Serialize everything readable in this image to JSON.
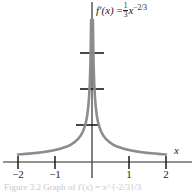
{
  "figure": {
    "function_label": {
      "fname": "f",
      "prime": "′",
      "arg": "(x)",
      "equals": "=",
      "frac_num": "1",
      "frac_den": "3",
      "base": "x",
      "exponent": "−2/3",
      "plain": "f'(x) = (1/3)x^(-2/3)"
    },
    "axis_label_x": "x",
    "caption": "Figure 3.2  Graph of f'(x) = x^{-2/3}/3",
    "colors": {
      "curve": "#8c8c8c",
      "axis": "#6e6e6e",
      "tick": "#1a1a1a",
      "text": "#1a1a1a",
      "background": "#ffffff"
    }
  },
  "chart_data": {
    "type": "line",
    "title": "",
    "subtitle": "",
    "xlabel": "x",
    "ylabel": "",
    "equation": "f'(x) = (1/3)x^(-2/3)",
    "grid": false,
    "legend": null,
    "xlim": [
      -2.0,
      2.0
    ],
    "ylim": [
      0.0,
      4.35
    ],
    "xticks": [
      -2,
      -1,
      1,
      2
    ],
    "xticklabels": [
      "−2",
      "−1",
      "1",
      "2"
    ],
    "yticks": [
      1,
      2,
      3
    ],
    "yticklabels": [
      "",
      "",
      ""
    ],
    "annotations": [
      {
        "text": "f'(x) = (1/3)x^(-2/3)",
        "x": 0.12,
        "y": 4.3
      }
    ],
    "series": [
      {
        "name": "f'(x) = (1/3)x^(-2/3)",
        "color": "#8c8c8c",
        "linewidth": 2.6,
        "branch_left": {
          "x": [
            -2.0,
            -1.9,
            -1.8,
            -1.7,
            -1.6,
            -1.5,
            -1.4,
            -1.3,
            -1.2,
            -1.1,
            -1.0,
            -0.9,
            -0.8,
            -0.7,
            -0.6,
            -0.5,
            -0.4,
            -0.35,
            -0.3,
            -0.25,
            -0.2,
            -0.16,
            -0.13,
            -0.1,
            -0.08,
            -0.06,
            -0.045,
            -0.033,
            -0.024,
            -0.017,
            -0.012,
            -0.0085,
            -0.006,
            -0.004,
            -0.0027,
            -0.0018
          ],
          "y": [
            0.21,
            0.2172,
            0.2251,
            0.2338,
            0.2434,
            0.254,
            0.266,
            0.2795,
            0.295,
            0.313,
            0.3333,
            0.3574,
            0.3862,
            0.421,
            0.4645,
            0.5291,
            0.6156,
            0.6732,
            0.7454,
            0.839,
            0.9745,
            1.1213,
            1.2825,
            1.5475,
            1.7941,
            2.175,
            2.642,
            3.2532,
            4.0268,
            5.05,
            6.34,
            7.98,
            10.1,
            13.1,
            17.0,
            22.0
          ]
        },
        "branch_right": {
          "x": [
            0.0018,
            0.0027,
            0.004,
            0.006,
            0.0085,
            0.012,
            0.017,
            0.024,
            0.033,
            0.045,
            0.06,
            0.08,
            0.1,
            0.13,
            0.16,
            0.2,
            0.25,
            0.3,
            0.35,
            0.4,
            0.5,
            0.6,
            0.7,
            0.8,
            0.9,
            1.0,
            1.1,
            1.2,
            1.3,
            1.4,
            1.5,
            1.6,
            1.7,
            1.8,
            1.9,
            2.0
          ],
          "y": [
            22.0,
            17.0,
            13.1,
            10.1,
            7.98,
            6.34,
            5.05,
            4.0268,
            3.2532,
            2.642,
            2.175,
            1.7941,
            1.5475,
            1.2825,
            1.1213,
            0.9745,
            0.839,
            0.7454,
            0.6732,
            0.6156,
            0.5291,
            0.4645,
            0.421,
            0.3862,
            0.3574,
            0.3333,
            0.313,
            0.295,
            0.2795,
            0.266,
            0.254,
            0.2434,
            0.2338,
            0.2251,
            0.2172,
            0.21
          ]
        }
      }
    ]
  }
}
